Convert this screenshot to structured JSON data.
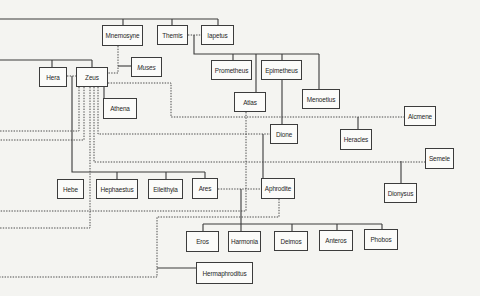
{
  "diagram": {
    "type": "family-tree"
  },
  "nodes": [
    {
      "id": "mnemosyne",
      "label": "Mnemosyne"
    },
    {
      "id": "themis",
      "label": "Themis"
    },
    {
      "id": "iapetus",
      "label": "Iapetus"
    },
    {
      "id": "hera",
      "label": "Hera"
    },
    {
      "id": "zeus",
      "label": "Zeus"
    },
    {
      "id": "muses",
      "label": "Muses"
    },
    {
      "id": "athena",
      "label": "Athena"
    },
    {
      "id": "prometheus",
      "label": "Prometheus"
    },
    {
      "id": "epimetheus",
      "label": "Epimetheus"
    },
    {
      "id": "atlas",
      "label": "Atlas"
    },
    {
      "id": "menoetius",
      "label": "Menoetius"
    },
    {
      "id": "alcmene",
      "label": "Alcmene"
    },
    {
      "id": "dione",
      "label": "Dione"
    },
    {
      "id": "heracles",
      "label": "Heracles"
    },
    {
      "id": "semele",
      "label": "Semele"
    },
    {
      "id": "dionysus",
      "label": "Dionysus"
    },
    {
      "id": "hebe",
      "label": "Hebe"
    },
    {
      "id": "hephaestus",
      "label": "Hephaestus"
    },
    {
      "id": "eileithyia",
      "label": "Eileithyia"
    },
    {
      "id": "ares",
      "label": "Ares"
    },
    {
      "id": "aphrodite",
      "label": "Aphrodite"
    },
    {
      "id": "eros",
      "label": "Eros"
    },
    {
      "id": "harmonia",
      "label": "Harmonia"
    },
    {
      "id": "deimos",
      "label": "Deimos"
    },
    {
      "id": "anteros",
      "label": "Anteros"
    },
    {
      "id": "phobos",
      "label": "Phobos"
    },
    {
      "id": "hermaphroditus",
      "label": "Hermaphroditus"
    }
  ],
  "relations": {
    "solid": "descent",
    "dotted": "union / partnership"
  },
  "colors": {
    "background": "#f4f4f1",
    "line": "#3a3a3a",
    "box_border": "#3c3c3c",
    "box_fill": "#fbfbf9",
    "text": "#262626"
  }
}
